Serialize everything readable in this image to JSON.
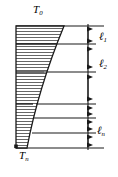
{
  "figure": {
    "type": "temperature-profile-diagram",
    "ink_color": "#1a1a1a",
    "hatch_color": "#3a3a3a",
    "labels": {
      "top_temperature": {
        "base": "T",
        "sub": "0",
        "text": "T0"
      },
      "bottom_temperature": {
        "base": "T",
        "sub": "n",
        "text": "Tn"
      },
      "layer_1": {
        "base": "ℓ",
        "sub": "1",
        "text": "ℓ1"
      },
      "layer_2": {
        "base": "ℓ",
        "sub": "2",
        "text": "ℓ2"
      },
      "layer_n": {
        "base": "ℓ",
        "sub": "n",
        "text": "ℓn"
      }
    },
    "profile": {
      "top_y": 26,
      "bottom_y": 148,
      "left_x": 16,
      "top_right_x": 64,
      "bottom_right_x": 27,
      "curve_note": "concave curve from top-right to bottom-left"
    },
    "layer_boundaries_y": [
      26,
      44,
      72,
      104,
      118,
      133,
      148
    ],
    "dimension_axis": {
      "x": 88,
      "ticks_y": [
        26,
        44,
        72,
        104,
        118,
        133,
        148
      ],
      "segments": [
        {
          "label": "ℓ1",
          "from_y": 26,
          "to_y": 44
        },
        {
          "label": "ℓ2",
          "from_y": 44,
          "to_y": 72
        },
        {
          "label": "",
          "from_y": 72,
          "to_y": 104
        },
        {
          "label": "",
          "from_y": 104,
          "to_y": 118
        },
        {
          "label": "",
          "from_y": 118,
          "to_y": 133
        },
        {
          "label": "ℓn",
          "from_y": 133,
          "to_y": 148
        }
      ]
    },
    "hatch": {
      "orientation": "horizontal",
      "spacing_px": 3
    }
  }
}
